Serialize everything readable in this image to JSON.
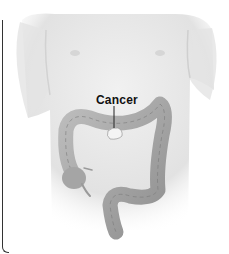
{
  "figure": {
    "labels": [
      {
        "text": "Cancer",
        "target": "transverse colon tumor"
      }
    ]
  },
  "colors": {
    "background": "#ffffff",
    "skin": "#e6e6e6",
    "colon": "#a9a9a9",
    "tumor": "#f2f2f2",
    "label": "#111111",
    "border": "#333333"
  }
}
